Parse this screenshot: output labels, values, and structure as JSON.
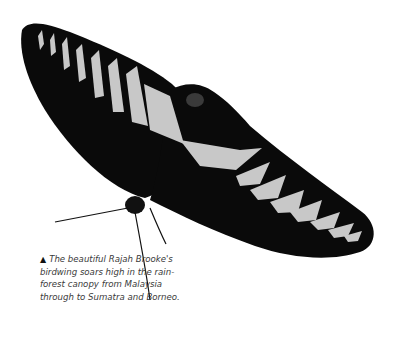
{
  "image": {
    "subject": "Rajah Brooke's birdwing butterfly",
    "colors": {
      "wing": "#0a0a0a",
      "markings": "#c8c8c8",
      "background": "#ffffff"
    }
  },
  "caption": {
    "marker": "▲",
    "text": "The beautiful Rajah Brooke's birdwing soars high in the rain-forest canopy from Malaysia through to Sumatra and Borneo."
  }
}
